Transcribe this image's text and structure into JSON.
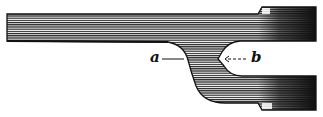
{
  "figure": {
    "labels": {
      "a": "a",
      "b": "b"
    },
    "colors": {
      "ink": "#111111",
      "background": "#ffffff",
      "dark_end": "#1a1a1a"
    }
  }
}
